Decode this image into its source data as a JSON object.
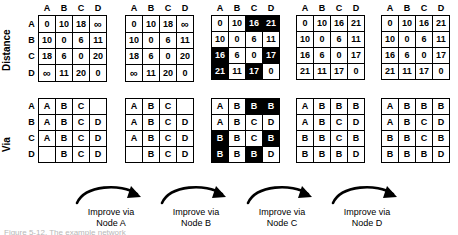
{
  "figure": {
    "row_section_labels": {
      "distance": "Distance",
      "via": "Via"
    },
    "node_labels": [
      "A",
      "B",
      "C",
      "D"
    ],
    "infinity_symbol": "∞",
    "caption": "Figure 5-12. The example network"
  },
  "steps": [
    {
      "line1": "Improve via",
      "line2": "Node A"
    },
    {
      "line1": "Improve via",
      "line2": "Node B"
    },
    {
      "line1": "Improve via",
      "line2": "Node C"
    },
    {
      "line1": "Improve via",
      "line2": "Node D"
    }
  ],
  "distance_matrices": [
    {
      "id": "distance-initial",
      "col_headers": [
        "A",
        "B",
        "C",
        "D"
      ],
      "row_headers": [
        "A",
        "B",
        "C",
        "D"
      ],
      "rows": [
        [
          {
            "v": "0",
            "hl": false
          },
          {
            "v": "10",
            "hl": false
          },
          {
            "v": "18",
            "hl": false
          },
          {
            "v": "∞",
            "hl": false
          }
        ],
        [
          {
            "v": "10",
            "hl": false
          },
          {
            "v": "0",
            "hl": false
          },
          {
            "v": "6",
            "hl": false
          },
          {
            "v": "11",
            "hl": false
          }
        ],
        [
          {
            "v": "18",
            "hl": false
          },
          {
            "v": "6",
            "hl": false
          },
          {
            "v": "0",
            "hl": false
          },
          {
            "v": "20",
            "hl": false
          }
        ],
        [
          {
            "v": "∞",
            "hl": false
          },
          {
            "v": "11",
            "hl": false
          },
          {
            "v": "20",
            "hl": false
          },
          {
            "v": "0",
            "hl": false
          }
        ]
      ]
    },
    {
      "id": "distance-after-a",
      "col_headers": [
        "A",
        "B",
        "C",
        "D"
      ],
      "row_headers": [
        "",
        "",
        "",
        ""
      ],
      "rows": [
        [
          {
            "v": "0",
            "hl": false
          },
          {
            "v": "10",
            "hl": false
          },
          {
            "v": "18",
            "hl": false
          },
          {
            "v": "∞",
            "hl": false
          }
        ],
        [
          {
            "v": "10",
            "hl": false
          },
          {
            "v": "0",
            "hl": false
          },
          {
            "v": "6",
            "hl": false
          },
          {
            "v": "11",
            "hl": false
          }
        ],
        [
          {
            "v": "18",
            "hl": false
          },
          {
            "v": "6",
            "hl": false
          },
          {
            "v": "0",
            "hl": false
          },
          {
            "v": "20",
            "hl": false
          }
        ],
        [
          {
            "v": "∞",
            "hl": false
          },
          {
            "v": "11",
            "hl": false
          },
          {
            "v": "20",
            "hl": false
          },
          {
            "v": "0",
            "hl": false
          }
        ]
      ]
    },
    {
      "id": "distance-after-b",
      "col_headers": [
        "A",
        "B",
        "C",
        "D"
      ],
      "row_headers": [
        "",
        "",
        "",
        ""
      ],
      "rows": [
        [
          {
            "v": "0",
            "hl": false
          },
          {
            "v": "10",
            "hl": false
          },
          {
            "v": "16",
            "hl": true
          },
          {
            "v": "21",
            "hl": true
          }
        ],
        [
          {
            "v": "10",
            "hl": false
          },
          {
            "v": "0",
            "hl": false
          },
          {
            "v": "6",
            "hl": false
          },
          {
            "v": "11",
            "hl": false
          }
        ],
        [
          {
            "v": "16",
            "hl": true
          },
          {
            "v": "6",
            "hl": false
          },
          {
            "v": "0",
            "hl": false
          },
          {
            "v": "17",
            "hl": true
          }
        ],
        [
          {
            "v": "21",
            "hl": true
          },
          {
            "v": "11",
            "hl": false
          },
          {
            "v": "17",
            "hl": true
          },
          {
            "v": "0",
            "hl": false
          }
        ]
      ]
    },
    {
      "id": "distance-after-c",
      "col_headers": [
        "A",
        "B",
        "C",
        "D"
      ],
      "row_headers": [
        "",
        "",
        "",
        ""
      ],
      "rows": [
        [
          {
            "v": "0",
            "hl": false
          },
          {
            "v": "10",
            "hl": false
          },
          {
            "v": "16",
            "hl": false
          },
          {
            "v": "21",
            "hl": false
          }
        ],
        [
          {
            "v": "10",
            "hl": false
          },
          {
            "v": "0",
            "hl": false
          },
          {
            "v": "6",
            "hl": false
          },
          {
            "v": "11",
            "hl": false
          }
        ],
        [
          {
            "v": "16",
            "hl": false
          },
          {
            "v": "6",
            "hl": false
          },
          {
            "v": "0",
            "hl": false
          },
          {
            "v": "17",
            "hl": false
          }
        ],
        [
          {
            "v": "21",
            "hl": false
          },
          {
            "v": "11",
            "hl": false
          },
          {
            "v": "17",
            "hl": false
          },
          {
            "v": "0",
            "hl": false
          }
        ]
      ]
    },
    {
      "id": "distance-after-d",
      "col_headers": [
        "A",
        "B",
        "C",
        "D"
      ],
      "row_headers": [
        "",
        "",
        "",
        ""
      ],
      "rows": [
        [
          {
            "v": "0",
            "hl": false
          },
          {
            "v": "10",
            "hl": false
          },
          {
            "v": "16",
            "hl": false
          },
          {
            "v": "21",
            "hl": false
          }
        ],
        [
          {
            "v": "10",
            "hl": false
          },
          {
            "v": "0",
            "hl": false
          },
          {
            "v": "6",
            "hl": false
          },
          {
            "v": "11",
            "hl": false
          }
        ],
        [
          {
            "v": "16",
            "hl": false
          },
          {
            "v": "6",
            "hl": false
          },
          {
            "v": "0",
            "hl": false
          },
          {
            "v": "17",
            "hl": false
          }
        ],
        [
          {
            "v": "21",
            "hl": false
          },
          {
            "v": "11",
            "hl": false
          },
          {
            "v": "17",
            "hl": false
          },
          {
            "v": "0",
            "hl": false
          }
        ]
      ]
    }
  ],
  "via_matrices": [
    {
      "id": "via-initial",
      "row_headers": [
        "A",
        "B",
        "C",
        "D"
      ],
      "rows": [
        [
          {
            "v": "A",
            "hl": false
          },
          {
            "v": "B",
            "hl": false
          },
          {
            "v": "C",
            "hl": false
          },
          {
            "v": "",
            "hl": false
          }
        ],
        [
          {
            "v": "A",
            "hl": false
          },
          {
            "v": "B",
            "hl": false
          },
          {
            "v": "C",
            "hl": false
          },
          {
            "v": "D",
            "hl": false
          }
        ],
        [
          {
            "v": "A",
            "hl": false
          },
          {
            "v": "B",
            "hl": false
          },
          {
            "v": "C",
            "hl": false
          },
          {
            "v": "D",
            "hl": false
          }
        ],
        [
          {
            "v": "",
            "hl": false
          },
          {
            "v": "B",
            "hl": false
          },
          {
            "v": "C",
            "hl": false
          },
          {
            "v": "D",
            "hl": false
          }
        ]
      ]
    },
    {
      "id": "via-after-a",
      "row_headers": [
        "",
        "",
        "",
        ""
      ],
      "rows": [
        [
          {
            "v": "A",
            "hl": false
          },
          {
            "v": "B",
            "hl": false
          },
          {
            "v": "C",
            "hl": false
          },
          {
            "v": "",
            "hl": false
          }
        ],
        [
          {
            "v": "A",
            "hl": false
          },
          {
            "v": "B",
            "hl": false
          },
          {
            "v": "C",
            "hl": false
          },
          {
            "v": "D",
            "hl": false
          }
        ],
        [
          {
            "v": "A",
            "hl": false
          },
          {
            "v": "B",
            "hl": false
          },
          {
            "v": "C",
            "hl": false
          },
          {
            "v": "D",
            "hl": false
          }
        ],
        [
          {
            "v": "",
            "hl": false
          },
          {
            "v": "B",
            "hl": false
          },
          {
            "v": "C",
            "hl": false
          },
          {
            "v": "D",
            "hl": false
          }
        ]
      ]
    },
    {
      "id": "via-after-b",
      "row_headers": [
        "",
        "",
        "",
        ""
      ],
      "rows": [
        [
          {
            "v": "A",
            "hl": false
          },
          {
            "v": "B",
            "hl": false
          },
          {
            "v": "B",
            "hl": true
          },
          {
            "v": "B",
            "hl": true
          }
        ],
        [
          {
            "v": "A",
            "hl": false
          },
          {
            "v": "B",
            "hl": false
          },
          {
            "v": "C",
            "hl": false
          },
          {
            "v": "D",
            "hl": false
          }
        ],
        [
          {
            "v": "B",
            "hl": true
          },
          {
            "v": "B",
            "hl": false
          },
          {
            "v": "C",
            "hl": false
          },
          {
            "v": "B",
            "hl": true
          }
        ],
        [
          {
            "v": "B",
            "hl": true
          },
          {
            "v": "B",
            "hl": false
          },
          {
            "v": "B",
            "hl": true
          },
          {
            "v": "D",
            "hl": false
          }
        ]
      ]
    },
    {
      "id": "via-after-c",
      "row_headers": [
        "",
        "",
        "",
        ""
      ],
      "rows": [
        [
          {
            "v": "A",
            "hl": false
          },
          {
            "v": "B",
            "hl": false
          },
          {
            "v": "B",
            "hl": false
          },
          {
            "v": "B",
            "hl": false
          }
        ],
        [
          {
            "v": "A",
            "hl": false
          },
          {
            "v": "B",
            "hl": false
          },
          {
            "v": "C",
            "hl": false
          },
          {
            "v": "D",
            "hl": false
          }
        ],
        [
          {
            "v": "B",
            "hl": false
          },
          {
            "v": "B",
            "hl": false
          },
          {
            "v": "C",
            "hl": false
          },
          {
            "v": "B",
            "hl": false
          }
        ],
        [
          {
            "v": "B",
            "hl": false
          },
          {
            "v": "B",
            "hl": false
          },
          {
            "v": "B",
            "hl": false
          },
          {
            "v": "D",
            "hl": false
          }
        ]
      ]
    },
    {
      "id": "via-after-d",
      "row_headers": [
        "",
        "",
        "",
        ""
      ],
      "rows": [
        [
          {
            "v": "A",
            "hl": false
          },
          {
            "v": "B",
            "hl": false
          },
          {
            "v": "B",
            "hl": false
          },
          {
            "v": "B",
            "hl": false
          }
        ],
        [
          {
            "v": "A",
            "hl": false
          },
          {
            "v": "B",
            "hl": false
          },
          {
            "v": "C",
            "hl": false
          },
          {
            "v": "D",
            "hl": false
          }
        ],
        [
          {
            "v": "B",
            "hl": false
          },
          {
            "v": "B",
            "hl": false
          },
          {
            "v": "C",
            "hl": false
          },
          {
            "v": "B",
            "hl": false
          }
        ],
        [
          {
            "v": "B",
            "hl": false
          },
          {
            "v": "B",
            "hl": false
          },
          {
            "v": "B",
            "hl": false
          },
          {
            "v": "D",
            "hl": false
          }
        ]
      ]
    }
  ]
}
